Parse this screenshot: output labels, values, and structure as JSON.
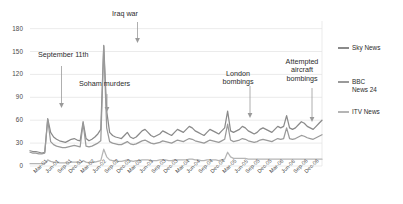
{
  "chart_data": {
    "type": "line",
    "title": "",
    "subtitle": "",
    "xlabel": "",
    "ylabel": "",
    "ylim": [
      0,
      190
    ],
    "yticks": [
      0,
      30,
      60,
      90,
      120,
      150,
      180
    ],
    "grid": true,
    "legend_position": "right",
    "x": [
      "Mar-01",
      "Jun-01",
      "Sep-01",
      "Dec-01",
      "Mar-02",
      "Jun-02",
      "Sep-02",
      "Dec-02",
      "Mar-03",
      "Jun-03",
      "Sep-03",
      "Dec-03",
      "Mar-04",
      "Jun-04",
      "Sep-04",
      "Dec-04",
      "Mar-05",
      "Jun-05",
      "Sep-05",
      "Dec-05",
      "Mar-06",
      "Jun-06",
      "Sep-06",
      "Dec-06"
    ],
    "xticks": [
      "Mar-01",
      "Jun-01",
      "Sep-01",
      "Dec-01",
      "Mar-02",
      "Jun-02",
      "Sep-02",
      "Dec-02",
      "Mar-03",
      "Jun-03",
      "Sep-03",
      "Dec-03",
      "Mar-04",
      "Jun-04",
      "Sep-04",
      "Dec-04",
      "Mar-05",
      "Jun-05",
      "Sep-05",
      "Dec-05",
      "Mar-06",
      "Jun-06",
      "Sep-06",
      "Dec-06"
    ],
    "series": [
      {
        "name": "Sky News",
        "color": "#8a8a8a",
        "values_monthly": [
          20,
          19,
          19,
          18,
          17,
          18,
          62,
          44,
          38,
          35,
          33,
          32,
          31,
          33,
          35,
          36,
          34,
          33,
          58,
          36,
          33,
          35,
          38,
          42,
          48,
          158,
          72,
          44,
          40,
          38,
          37,
          36,
          40,
          44,
          38,
          36,
          38,
          42,
          46,
          48,
          44,
          40,
          38,
          40,
          42,
          46,
          44,
          42,
          40,
          44,
          48,
          46,
          44,
          48,
          52,
          50,
          46,
          44,
          42,
          40,
          44,
          48,
          46,
          44,
          42,
          46,
          50,
          72,
          46,
          44,
          46,
          48,
          52,
          50,
          46,
          44,
          42,
          44,
          48,
          50,
          48,
          46,
          44,
          48,
          52,
          50,
          52,
          66,
          50,
          48,
          50,
          54,
          58,
          56,
          52,
          50,
          48,
          52,
          56,
          60
        ]
      },
      {
        "name": "BBC News 24",
        "color": "#9a9a9a",
        "values_monthly": [
          18,
          17,
          17,
          16,
          16,
          17,
          61,
          32,
          28,
          26,
          25,
          24,
          24,
          25,
          26,
          27,
          26,
          25,
          56,
          26,
          25,
          26,
          28,
          30,
          33,
          157,
          50,
          32,
          30,
          29,
          28,
          28,
          30,
          32,
          29,
          28,
          29,
          31,
          33,
          34,
          32,
          30,
          29,
          30,
          31,
          33,
          32,
          31,
          30,
          32,
          34,
          33,
          32,
          34,
          36,
          35,
          33,
          32,
          31,
          30,
          32,
          34,
          33,
          32,
          31,
          33,
          35,
          55,
          34,
          32,
          33,
          34,
          36,
          35,
          33,
          32,
          31,
          32,
          34,
          35,
          34,
          33,
          32,
          34,
          36,
          35,
          36,
          50,
          36,
          35,
          36,
          38,
          40,
          39,
          37,
          36,
          35,
          37,
          39,
          41
        ]
      },
      {
        "name": "ITV News",
        "color": "#b5b5b5",
        "values_monthly": [
          3,
          3,
          3,
          3,
          3,
          3,
          8,
          6,
          5,
          5,
          4,
          4,
          4,
          4,
          5,
          5,
          5,
          4,
          7,
          5,
          4,
          5,
          5,
          6,
          7,
          22,
          12,
          8,
          7,
          7,
          6,
          6,
          7,
          8,
          7,
          6,
          7,
          7,
          8,
          8,
          8,
          7,
          7,
          7,
          8,
          8,
          8,
          7,
          7,
          8,
          8,
          8,
          8,
          8,
          9,
          9,
          8,
          8,
          7,
          7,
          8,
          8,
          8,
          8,
          7,
          8,
          9,
          18,
          12,
          10,
          10,
          10,
          10,
          10,
          9,
          9,
          9,
          9,
          9,
          9,
          9,
          9,
          9,
          9,
          9,
          9,
          9,
          9,
          9,
          9,
          9,
          9,
          9,
          9,
          9,
          9,
          9,
          9,
          9,
          9
        ]
      }
    ],
    "annotations": [
      {
        "label": "September 11th",
        "x": "Sep-01",
        "peak": 62
      },
      {
        "label": "Soham murders",
        "x": "Aug-02",
        "peak": 58
      },
      {
        "label": "Iraq war",
        "x": "Mar-03",
        "peak": 158
      },
      {
        "label": "London bombings",
        "x": "Jul-05",
        "peak": 72
      },
      {
        "label": "Attempted aircraft bombings",
        "x": "Aug-06",
        "peak": 66
      }
    ]
  },
  "axis": {
    "ytick_labels": [
      "180",
      "150",
      "120",
      "90",
      "60",
      "30",
      "0"
    ],
    "xtick_labels": [
      "Mar-01",
      "Jun-01",
      "Sep-01",
      "Dec-01",
      "Mar-02",
      "Jun-02",
      "Sep-02",
      "Dec-02",
      "Mar-03",
      "Jun-03",
      "Sep-03",
      "Dec-03",
      "Mar-04",
      "Jun-04",
      "Sep-04",
      "Dec-04",
      "Mar-05",
      "Jun-05",
      "Sep-05",
      "Dec-05",
      "Mar-06",
      "Jun-06",
      "Sep-06",
      "Dec-06"
    ]
  },
  "annotations": {
    "sept11": "September 11th",
    "soham": "Soham murders",
    "iraq": "Iraq war",
    "london": "London\nbombings",
    "aircraft": "Attempted\naircraft\nbombings"
  },
  "legend": {
    "items": [
      {
        "label": "Sky News",
        "color": "#8a8a8a"
      },
      {
        "label": "BBC\nNews 24",
        "color": "#9a9a9a"
      },
      {
        "label": "ITV News",
        "color": "#b5b5b5"
      }
    ]
  },
  "colors": {
    "grid": "#e2e2e2",
    "axis_text": "#4a4a4a",
    "annotation_text": "#2b2b2b",
    "arrow": "#9a9a9a"
  }
}
